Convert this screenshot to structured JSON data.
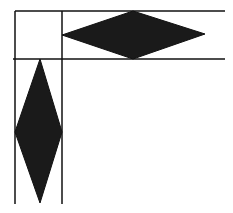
{
  "diagram": {
    "fill_color": "#1a1a1a",
    "line_color": "#111111",
    "background": "#ffffff",
    "lines": {
      "vertical": [
        {
          "x": 15,
          "y1": 11,
          "y2": 204
        },
        {
          "x": 62,
          "y1": 11,
          "y2": 204
        }
      ],
      "horizontal": [
        {
          "y": 11,
          "x1": 15,
          "x2": 225
        },
        {
          "y": 59,
          "x1": 13,
          "x2": 225
        }
      ]
    },
    "shapes": [
      {
        "name": "horizontal-diamond",
        "points": "62,35 133,11 205,34 133,59"
      },
      {
        "name": "vertical-diamond",
        "points": "40,59 62,132 40,203 15,132"
      }
    ]
  }
}
